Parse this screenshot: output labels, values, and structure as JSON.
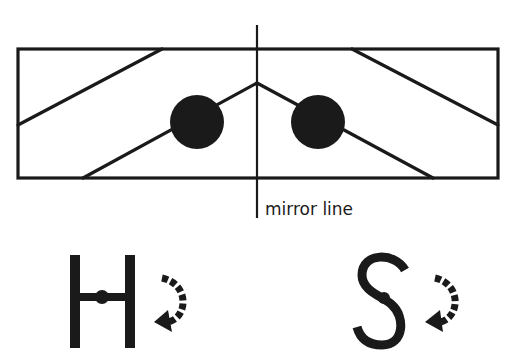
{
  "diagram": {
    "mirror_label": "mirror line",
    "colors": {
      "stroke": "#1a1a1a",
      "fill": "#1a1a1a",
      "background": "#ffffff"
    },
    "shapes": {
      "rectangle": "rectangle with symmetric diagonal lines",
      "left_dot": "filled circle",
      "right_dot": "filled circle"
    },
    "letters": [
      {
        "char": "H",
        "note": "letter with center pivot dot and rotation arrow"
      },
      {
        "char": "S",
        "note": "letter with center pivot dot and rotation arrow"
      }
    ]
  }
}
